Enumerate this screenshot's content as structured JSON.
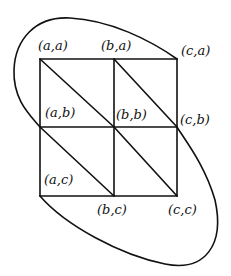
{
  "diagram": {
    "type": "triangulated grid with enclosing loop",
    "grid": {
      "columns": [
        "a",
        "b",
        "c"
      ],
      "rows": [
        "a",
        "b",
        "c"
      ]
    },
    "labels": {
      "aa": "(a,a)",
      "ba": "(b,a)",
      "ca": "(c,a)",
      "ab": "(a,b)",
      "bb": "(b,b)",
      "cb": "(c,b)",
      "ac": "(a,c)",
      "bc": "(b,c)",
      "cc": "(c,c)"
    },
    "colors": {
      "stroke": "#111111",
      "background": "#ffffff"
    }
  }
}
